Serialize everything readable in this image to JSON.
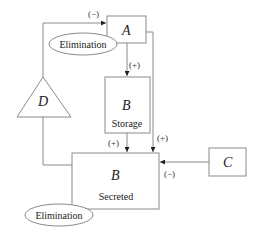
{
  "diagram": {
    "nodes": {
      "a": {
        "label": "A"
      },
      "b_storage": {
        "label": "B",
        "sublabel": "Storage"
      },
      "b_secreted": {
        "label": "B",
        "sublabel": "Secreted"
      },
      "c": {
        "label": "C"
      },
      "d": {
        "label": "D"
      },
      "elimination_top": {
        "label": "Elimination"
      },
      "elimination_bottom": {
        "label": "Elimination"
      }
    },
    "edges": [
      {
        "from": "D",
        "to": "A",
        "sign": "(−)"
      },
      {
        "from": "A",
        "to": "B Storage",
        "sign": "(+)"
      },
      {
        "from": "B Storage",
        "to": "B Secreted",
        "sign": "(+)"
      },
      {
        "from": "A",
        "to": "B Secreted",
        "sign": "(+)"
      },
      {
        "from": "C",
        "to": "B Secreted",
        "sign": "(−)"
      },
      {
        "from": "B Secreted",
        "to": "D",
        "sign": ""
      }
    ],
    "colors": {
      "stroke": "#8a8a8a",
      "text": "#222222",
      "background": "#ffffff"
    }
  }
}
